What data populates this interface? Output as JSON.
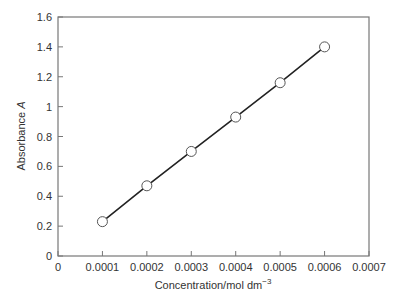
{
  "chart_data": {
    "type": "scatter",
    "title": "",
    "xlabel": "Concentration/mol dm",
    "xlabel_superscript": "−3",
    "ylabel": "Absorbance",
    "ylabel_italic": "A",
    "xlim": [
      0,
      0.0007
    ],
    "ylim": [
      0,
      1.6
    ],
    "x_ticks": [
      "0",
      "0.0001",
      "0.0002",
      "0.0003",
      "0.0004",
      "0.0005",
      "0.0006",
      "0.0007"
    ],
    "x_tick_values": [
      0,
      0.0001,
      0.0002,
      0.0003,
      0.0004,
      0.0005,
      0.0006,
      0.0007
    ],
    "y_ticks": [
      "0",
      "0.2",
      "0.4",
      "0.6",
      "0.8",
      "1",
      "1.2",
      "1.4",
      "1.6"
    ],
    "y_tick_values": [
      0,
      0.2,
      0.4,
      0.6,
      0.8,
      1.0,
      1.2,
      1.4,
      1.6
    ],
    "grid": false,
    "legend": null,
    "series": [
      {
        "name": "Absorbance",
        "marker": "open-circle",
        "line": "straight-connect",
        "x": [
          0.0001,
          0.0002,
          0.0003,
          0.0004,
          0.0005,
          0.0006
        ],
        "y": [
          0.23,
          0.47,
          0.7,
          0.93,
          1.16,
          1.4
        ]
      }
    ]
  },
  "colors": {
    "axis": "#777777",
    "line": "#222222",
    "marker_fill": "#ffffff",
    "marker_stroke": "#555555",
    "text": "#333333"
  }
}
